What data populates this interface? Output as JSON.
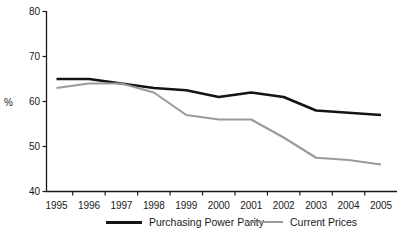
{
  "chart_data": {
    "type": "line",
    "title": "",
    "subtitle": "",
    "xlabel": "",
    "ylabel": "%",
    "categories": [
      "1995",
      "1996",
      "1997",
      "1998",
      "1999",
      "2000",
      "2001",
      "2002",
      "2003",
      "2004",
      "2005"
    ],
    "x": [
      1995,
      1996,
      1997,
      1998,
      1999,
      2000,
      2001,
      2002,
      2003,
      2004,
      2005
    ],
    "series": [
      {
        "name": "Purchasing Power Parity",
        "color": "#141414",
        "values": [
          65,
          65,
          64,
          63,
          62.5,
          61,
          62,
          61,
          58,
          57.5,
          57
        ]
      },
      {
        "name": "Current Prices",
        "color": "#9a9a9a",
        "values": [
          63,
          64,
          64,
          62,
          57,
          56,
          56,
          52,
          47.5,
          47,
          46
        ]
      }
    ],
    "ylim": [
      40,
      80
    ],
    "yticks": [
      40,
      50,
      60,
      70,
      80
    ],
    "ytick_labels": [
      "40",
      "50",
      "60",
      "70",
      "80"
    ],
    "xlim": [
      1995,
      2005
    ],
    "grid": false,
    "legend_position": "bottom"
  },
  "legend": {
    "items": [
      {
        "label": "Purchasing Power Parity"
      },
      {
        "label": "Current Prices"
      }
    ]
  },
  "axes": {
    "y_axis_label": "%"
  }
}
